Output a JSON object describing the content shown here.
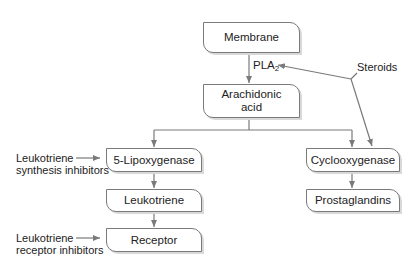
{
  "diagram": {
    "type": "pathway-flowchart",
    "nodes": {
      "membrane": "Membrane",
      "arachidonic_line1": "Arachidonic",
      "arachidonic_line2": "acid",
      "lipoxygenase": "5-Lipoxygenase",
      "leukotriene": "Leukotriene",
      "receptor": "Receptor",
      "cyclooxygenase": "Cyclooxygenase",
      "prostaglandins": "Prostaglandins"
    },
    "edge_labels": {
      "pla_main": "PLA",
      "pla_sub": "2"
    },
    "inhibitors": {
      "steroids": "Steroids",
      "synthesis_line1": "Leukotriene",
      "synthesis_line2": "synthesis inhibitors",
      "receptor_line1": "Leukotriene",
      "receptor_line2": "receptor inhibitors"
    },
    "edges": [
      [
        "Membrane",
        "Arachidonic acid",
        "PLA2"
      ],
      [
        "Arachidonic acid",
        "5-Lipoxygenase"
      ],
      [
        "Arachidonic acid",
        "Cyclooxygenase"
      ],
      [
        "5-Lipoxygenase",
        "Leukotriene"
      ],
      [
        "Leukotriene",
        "Receptor"
      ],
      [
        "Cyclooxygenase",
        "Prostaglandins"
      ],
      [
        "Steroids",
        "PLA2"
      ],
      [
        "Steroids",
        "Cyclooxygenase"
      ],
      [
        "Leukotriene synthesis inhibitors",
        "5-Lipoxygenase"
      ],
      [
        "Leukotriene receptor inhibitors",
        "Receptor"
      ]
    ],
    "colors": {
      "stroke": "#7a7a7a",
      "shadow": "#d9d9d9",
      "text": "#222222"
    }
  }
}
